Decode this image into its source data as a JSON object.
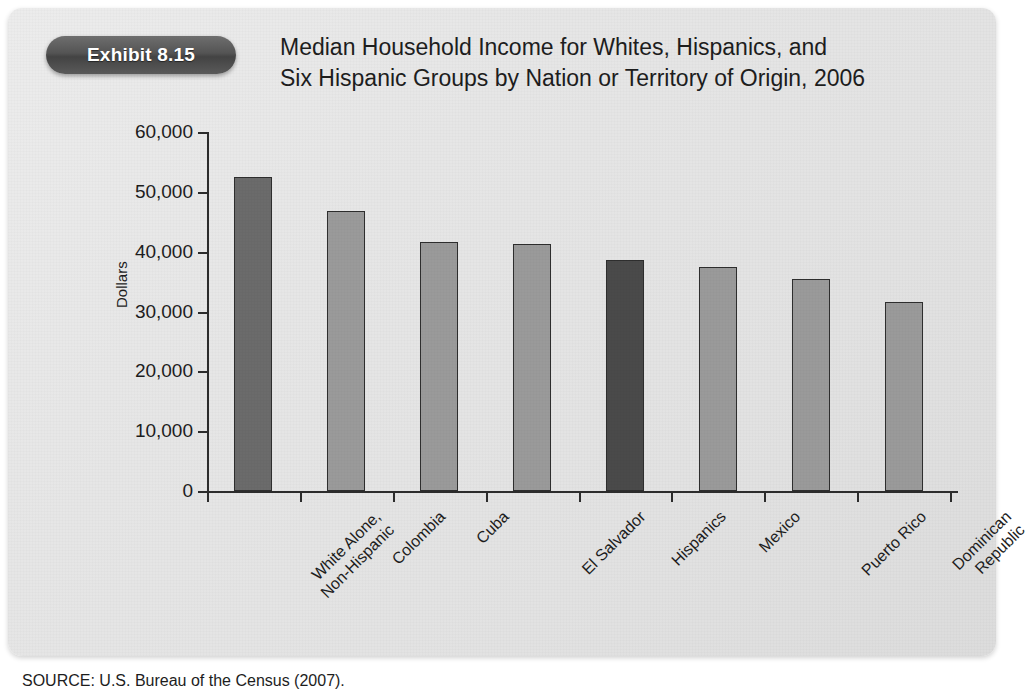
{
  "exhibit": {
    "badge_label": "Exhibit 8.15",
    "title_line1": "Median Household Income for Whites, Hispanics, and",
    "title_line2": "Six Hispanic Groups by Nation or Territory of Origin, 2006",
    "source": "SOURCE: U.S. Bureau of the Census (2007)."
  },
  "colors": {
    "card_background": "#e6e6e6",
    "badge": "#545454",
    "bar_light": "#9a9a9a",
    "bar_medium": "#6b6b6b",
    "bar_dark": "#4a4a4a",
    "axis": "#2c2c2c",
    "text": "#1d1d1d"
  },
  "chart_data": {
    "type": "bar",
    "title": "Median Household Income for Whites, Hispanics, and Six Hispanic Groups by Nation or Territory of Origin, 2006",
    "xlabel": "",
    "ylabel": "Dollars",
    "ylim": [
      0,
      60000
    ],
    "ytick_values": [
      0,
      10000,
      20000,
      30000,
      40000,
      50000,
      60000
    ],
    "ytick_labels": [
      "0",
      "10,000",
      "20,000",
      "30,000",
      "40,000",
      "50,000",
      "60,000"
    ],
    "grid": false,
    "legend": "none",
    "categories": [
      "White Alone, Non-Hispanic",
      "Colombia",
      "Cuba",
      "El Salvador",
      "Hispanics",
      "Mexico",
      "Puerto Rico",
      "Dominican Republic"
    ],
    "category_lines": [
      [
        "White Alone,",
        "Non-Hispanic"
      ],
      [
        "Colombia",
        ""
      ],
      [
        "Cuba",
        ""
      ],
      [
        "El Salvador",
        ""
      ],
      [
        "Hispanics",
        ""
      ],
      [
        "Mexico",
        ""
      ],
      [
        "Puerto Rico",
        ""
      ],
      [
        "Dominican",
        "Republic"
      ]
    ],
    "values": [
      52500,
      46800,
      41600,
      41300,
      38600,
      37400,
      35400,
      31600
    ],
    "bar_shades": [
      "medium",
      "light",
      "light",
      "light",
      "dark",
      "light",
      "light",
      "light"
    ]
  }
}
